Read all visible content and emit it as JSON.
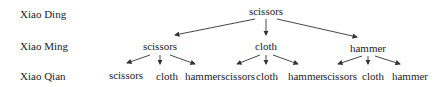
{
  "rows": [
    {
      "label": "Xiao Ding"
    },
    {
      "label": "Xiao Ming"
    },
    {
      "label": "Xiao Qian"
    }
  ],
  "tree": {
    "root": {
      "label": "scissors"
    },
    "level1": [
      {
        "label": "scissors",
        "children": [
          "scissors",
          "cloth",
          "hammer"
        ]
      },
      {
        "label": "cloth",
        "children": [
          "scissors",
          "cloth",
          "hammer"
        ]
      },
      {
        "label": "hammer",
        "children": [
          "scissors",
          "cloth",
          "hammer"
        ]
      }
    ]
  },
  "colors": {
    "text": "#222222",
    "edge": "#333333"
  }
}
